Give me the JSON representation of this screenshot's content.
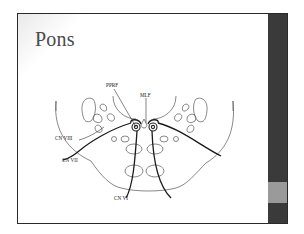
{
  "slide": {
    "title": "Pons",
    "labels": {
      "pprf": "PPRF",
      "mlf": "MLF",
      "cn8": "CN VIII",
      "cn7": "CN VII",
      "cn6": "CN VI"
    }
  },
  "colors": {
    "sidebar": "#3a3a3a",
    "sidebar_accent": "#9a9a9a",
    "frame": "#2a2a2a",
    "ink": "#222222"
  }
}
